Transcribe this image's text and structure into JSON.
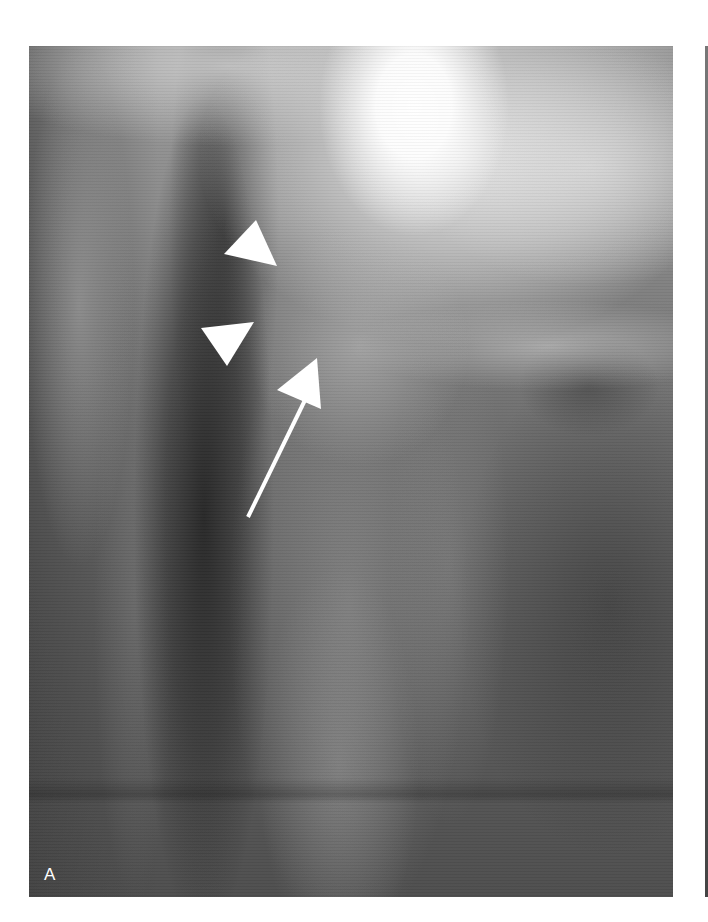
{
  "figure": {
    "panel_label": "A",
    "colors": {
      "annotation": "#ffffff",
      "background": "#ffffff"
    },
    "annotations": [
      {
        "type": "arrowhead",
        "name": "upper-arrowhead",
        "points": "227,174 195,208 248,220"
      },
      {
        "type": "arrowhead",
        "name": "lower-arrowhead",
        "points": "172,282 225,276 198,320"
      },
      {
        "type": "arrow",
        "name": "long-arrow",
        "head_points": "288,312 248,344 292,363",
        "shaft": {
          "x1": 278,
          "y1": 350,
          "x2": 219,
          "y2": 471
        }
      }
    ]
  }
}
